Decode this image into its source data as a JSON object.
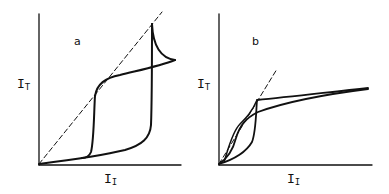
{
  "panels": [
    {
      "id": "a",
      "letter": "a",
      "ylabel": {
        "main": "I",
        "sub": "T"
      },
      "xlabel": {
        "main": "I",
        "sub": "I"
      },
      "description": "Hysteresis loop with vertical jumps and a cusp at high input; dashed diagonal reference line"
    },
    {
      "id": "b",
      "letter": "b",
      "ylabel": {
        "main": "I",
        "sub": "T"
      },
      "xlabel": {
        "main": "I",
        "sub": "I"
      },
      "description": "Narrow hysteresis near origin then saturating branches; dashed diagonal reference line"
    }
  ],
  "colors": {
    "stroke": "#111111",
    "background": "#ffffff"
  }
}
